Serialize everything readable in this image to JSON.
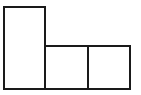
{
  "diagram": {
    "stroke_color": "#1a1a1a",
    "fill_color": "#ffffff",
    "shapes": [
      {
        "id": "tall-rect",
        "x": 3,
        "y": 6,
        "w": 43,
        "h": 84
      },
      {
        "id": "square-1",
        "x": 44,
        "y": 45,
        "w": 45,
        "h": 45
      },
      {
        "id": "square-2",
        "x": 87,
        "y": 45,
        "w": 44,
        "h": 45
      }
    ]
  }
}
